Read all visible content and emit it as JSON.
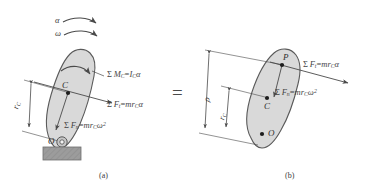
{
  "figure": {
    "background": "#ffffff",
    "body_fill": "#d9d9d9",
    "body_stroke": "#5a5a5a",
    "line_color": "#4a4a4a",
    "support_fill": "#9a9a9a",
    "equals_sign": "="
  },
  "panel_a": {
    "caption": "(a)",
    "kinematics": {
      "alpha_label": "α",
      "omega_label": "ω"
    },
    "points": {
      "center_of_mass": "C",
      "pivot": "O"
    },
    "dimensions": {
      "r_c_label": "r",
      "r_c_sub": "C"
    },
    "equations": [
      {
        "name": "moment-about-C",
        "sigma": "Σ",
        "lhs_main": "M",
        "lhs_sub": "C",
        "eq": "=",
        "rhs_main": "I",
        "rhs_sub": "C",
        "rhs_tail": "α",
        "plain": "Σ M_C = I_C α"
      },
      {
        "name": "tangential-force",
        "sigma": "Σ",
        "lhs_main": "F",
        "lhs_sub": "t",
        "eq": "=",
        "rhs_main": "mr",
        "rhs_sub": "C",
        "rhs_tail": "α",
        "plain": "Σ F_t = mr_C α"
      },
      {
        "name": "normal-force",
        "sigma": "Σ",
        "lhs_main": "F",
        "lhs_sub": "n",
        "eq": "=",
        "rhs_main": "mr",
        "rhs_sub": "C",
        "rhs_tail": "ω",
        "rhs_sup": "2",
        "plain": "Σ F_n = mr_C ω²"
      }
    ]
  },
  "panel_b": {
    "caption": "(b)",
    "points": {
      "percussion": "P",
      "center_of_mass": "C",
      "pivot": "O"
    },
    "dimensions": {
      "rho_label": "ρ",
      "r_c_label": "r",
      "r_c_sub": "C"
    },
    "equations": [
      {
        "name": "tangential-force",
        "sigma": "Σ",
        "lhs_main": "F",
        "lhs_sub": "t",
        "eq": "=",
        "rhs_main": "mr",
        "rhs_sub": "C",
        "rhs_tail": "α",
        "plain": "Σ F_t = mr_C α"
      },
      {
        "name": "normal-force",
        "sigma": "Σ",
        "lhs_main": "F",
        "lhs_sub": "n",
        "eq": "=",
        "rhs_main": "mr",
        "rhs_sub": "C",
        "rhs_tail": "ω",
        "rhs_sup": "2",
        "plain": "Σ F_n = mr_C ω²"
      }
    ]
  }
}
